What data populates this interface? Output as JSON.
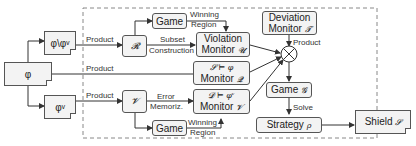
{
  "diagram": {
    "inputs": {
      "phi": "φ",
      "phi_minus_phiv": "φ\\φᵛ",
      "phi_v": "φᵛ"
    },
    "edge_labels": {
      "product_top": "Product",
      "product_mid": "Product",
      "product_bottom": "Product",
      "subset_construction_1": "Subset",
      "subset_construction_2": "Construction",
      "winning_region_top_1": "Winning",
      "winning_region_top_2": "Region",
      "error_memoriz_1": "Error",
      "error_memoriz_2": "Memoriz.",
      "winning_region_bottom_1": "Winning",
      "winning_region_bottom_2": "Region",
      "product_right": "Product",
      "solve": "Solve"
    },
    "nodes": {
      "automaton_r": "𝓡",
      "automaton_v": "𝓥",
      "game_top": "Game",
      "game_bottom": "Game",
      "violation_monitor_line1": "Violation",
      "violation_monitor_line2": "Monitor",
      "violation_monitor_sym": "𝓤",
      "monitor_q_line1": "𝓢 ⊨ φ",
      "monitor_q_line2": "Monitor",
      "monitor_q_sym": "𝓠",
      "monitor_v_line1": "𝓓 ⊨ φᵛ",
      "monitor_v_line2": "Monitor",
      "monitor_v_sym": "𝓥",
      "deviation_monitor_line1": "Deviation",
      "deviation_monitor_line2": "Monitor",
      "deviation_monitor_sym": "𝓣",
      "product_operator": "⊗",
      "game_g_label": "Game",
      "game_g_sym": "𝓖",
      "strategy_label": "Strategy",
      "strategy_sym": "ρ",
      "shield_label": "Shield",
      "shield_sym": "𝓢"
    }
  }
}
